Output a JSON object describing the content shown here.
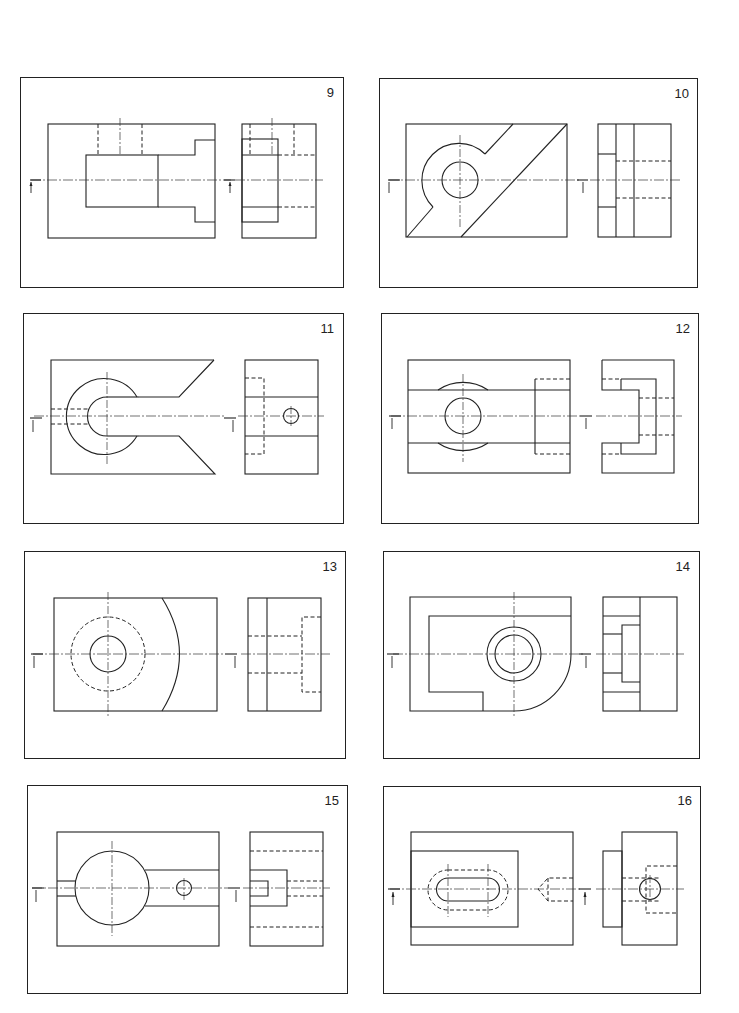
{
  "page": {
    "background": "#ffffff",
    "line_color": "#222222"
  },
  "exercises": [
    {
      "number": "9",
      "views": [
        "front-view",
        "side-view"
      ],
      "features": [
        "stepped block",
        "hidden slot",
        "section marker"
      ]
    },
    {
      "number": "10",
      "views": [
        "front-view",
        "side-view"
      ],
      "features": [
        "diagonal cut",
        "boss with bore",
        "section marker"
      ]
    },
    {
      "number": "11",
      "views": [
        "front-view",
        "side-view"
      ],
      "features": [
        "V-notch",
        "U-slot with round end",
        "small hole",
        "section marker"
      ]
    },
    {
      "number": "12",
      "views": [
        "front-view",
        "side-view"
      ],
      "features": [
        "horizontal channel",
        "circular bore",
        "stepped recess",
        "section marker"
      ]
    },
    {
      "number": "13",
      "views": [
        "front-view",
        "side-view"
      ],
      "features": [
        "hole with hidden counterbore",
        "curved face",
        "section marker"
      ]
    },
    {
      "number": "14",
      "views": [
        "front-view",
        "side-view"
      ],
      "features": [
        "rounded corner",
        "concentric bore",
        "L-shaped pocket",
        "section marker"
      ]
    },
    {
      "number": "15",
      "views": [
        "front-view",
        "side-view"
      ],
      "features": [
        "large round boss",
        "slot",
        "small hole",
        "section marker"
      ]
    },
    {
      "number": "16",
      "views": [
        "front-view",
        "side-view"
      ],
      "features": [
        "oblong slot",
        "hidden counterbore",
        "drilled hole",
        "section marker"
      ]
    }
  ]
}
